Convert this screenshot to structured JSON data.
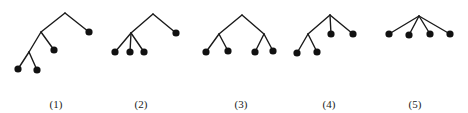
{
  "figure": {
    "edge_color": "#1a1a1a",
    "node_color": "#111111",
    "trees": [
      {
        "label": "(1)",
        "label_x": 56,
        "nodes": {
          "r": [
            65,
            13
          ],
          "a": [
            41,
            32
          ],
          "b": [
            29,
            52
          ],
          "l1": [
            89,
            32
          ],
          "l2": [
            54,
            50
          ],
          "l3": [
            18,
            69
          ],
          "l4": [
            37,
            70
          ]
        },
        "edges": [
          [
            "r",
            "a"
          ],
          [
            "r",
            "l1"
          ],
          [
            "a",
            "l2"
          ],
          [
            "a",
            "b"
          ],
          [
            "b",
            "l3"
          ],
          [
            "b",
            "l4"
          ]
        ],
        "leaves": [
          "l1",
          "l2",
          "l3",
          "l4"
        ]
      },
      {
        "label": "(2)",
        "label_x": 141,
        "nodes": {
          "r": [
            153,
            14
          ],
          "a": [
            131,
            33
          ],
          "l1": [
            176,
            33
          ],
          "l2": [
            115,
            52
          ],
          "l3": [
            130,
            52
          ],
          "l4": [
            144,
            52
          ]
        },
        "edges": [
          [
            "r",
            "a"
          ],
          [
            "r",
            "l1"
          ],
          [
            "a",
            "l2"
          ],
          [
            "a",
            "l3"
          ],
          [
            "a",
            "l4"
          ]
        ],
        "leaves": [
          "l1",
          "l2",
          "l3",
          "l4"
        ]
      },
      {
        "label": "(3)",
        "label_x": 241,
        "nodes": {
          "r": [
            242,
            15
          ],
          "a": [
            219,
            34
          ],
          "b": [
            264,
            34
          ],
          "l1": [
            206,
            52
          ],
          "l2": [
            228,
            51
          ],
          "l3": [
            255,
            52
          ],
          "l4": [
            273,
            51
          ]
        },
        "edges": [
          [
            "r",
            "a"
          ],
          [
            "r",
            "b"
          ],
          [
            "a",
            "l1"
          ],
          [
            "a",
            "l2"
          ],
          [
            "b",
            "l3"
          ],
          [
            "b",
            "l4"
          ]
        ],
        "leaves": [
          "l1",
          "l2",
          "l3",
          "l4"
        ]
      },
      {
        "label": "(4)",
        "label_x": 329,
        "nodes": {
          "r": [
            330,
            15
          ],
          "a": [
            308,
            34
          ],
          "l1": [
            331,
            34
          ],
          "l2": [
            353,
            34
          ],
          "l3": [
            297,
            53
          ],
          "l4": [
            317,
            52
          ]
        },
        "edges": [
          [
            "r",
            "a"
          ],
          [
            "r",
            "l1"
          ],
          [
            "r",
            "l2"
          ],
          [
            "a",
            "l3"
          ],
          [
            "a",
            "l4"
          ]
        ],
        "leaves": [
          "l1",
          "l2",
          "l3",
          "l4"
        ]
      },
      {
        "label": "(5)",
        "label_x": 415,
        "nodes": {
          "r": [
            419,
            16
          ],
          "l1": [
            389,
            34
          ],
          "l2": [
            409,
            35
          ],
          "l3": [
            430,
            34
          ],
          "l4": [
            450,
            34
          ]
        },
        "edges": [
          [
            "r",
            "l1"
          ],
          [
            "r",
            "l2"
          ],
          [
            "r",
            "l3"
          ],
          [
            "r",
            "l4"
          ]
        ],
        "leaves": [
          "l1",
          "l2",
          "l3",
          "l4"
        ]
      }
    ]
  }
}
